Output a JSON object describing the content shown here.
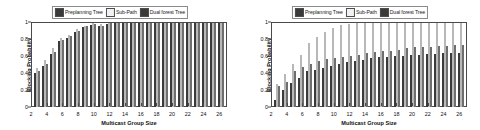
{
  "figure": {
    "panels": [
      {
        "id": "left-panel",
        "legend": {
          "items": [
            {
              "label": "Preplanning Tree",
              "color": "#3a3a3a",
              "icon": "legend-swatch-preplanning"
            },
            {
              "label": "Sub-Path",
              "color": "#f2f2f2",
              "icon": "legend-swatch-subpath"
            },
            {
              "label": "Dual forest Tree",
              "color": "#6e6e6e",
              "icon": "legend-swatch-dualforest"
            }
          ]
        },
        "chart_data": {
          "type": "bar",
          "title": "",
          "xlabel": "Multicast Group Size",
          "ylabel": "Blocking Probability",
          "xlim": [
            2,
            27
          ],
          "ylim": [
            0,
            1
          ],
          "yticks": [
            0,
            0.2,
            0.4,
            0.6,
            0.8,
            1
          ],
          "ytick_labels": [
            "0",
            "0.2",
            "0.4",
            "0.6",
            "0.8",
            "1"
          ],
          "xticks": [
            2,
            4,
            6,
            8,
            10,
            12,
            14,
            16,
            18,
            20,
            22,
            24,
            26
          ],
          "grid": false,
          "legend_position": "top-center",
          "categories": [
            3,
            4,
            5,
            6,
            7,
            8,
            9,
            10,
            11,
            12,
            13,
            14,
            15,
            16,
            17,
            18,
            19,
            20,
            21,
            22,
            23,
            24,
            25,
            26
          ],
          "series": [
            {
              "name": "Preplanning Tree",
              "color": "#3a3a3a",
              "values": [
                0.41,
                0.49,
                0.63,
                0.78,
                0.82,
                0.89,
                0.95,
                0.98,
                0.96,
                0.99,
                1.0,
                1.0,
                1.0,
                1.0,
                1.0,
                1.0,
                1.0,
                1.0,
                1.0,
                1.0,
                1.0,
                1.0,
                1.0,
                1.0
              ]
            },
            {
              "name": "Sub-Path",
              "color": "#ededed",
              "values": [
                0.46,
                0.56,
                0.7,
                0.82,
                0.86,
                0.93,
                0.97,
                1.0,
                0.99,
                1.0,
                1.0,
                1.0,
                1.0,
                1.0,
                1.0,
                1.0,
                1.0,
                1.0,
                1.0,
                1.0,
                1.0,
                1.0,
                1.0,
                1.0
              ]
            },
            {
              "name": "Dual forest Tree",
              "color": "#6e6e6e",
              "values": [
                0.43,
                0.51,
                0.66,
                0.8,
                0.84,
                0.91,
                0.96,
                0.99,
                0.97,
                1.0,
                1.0,
                1.0,
                1.0,
                1.0,
                1.0,
                1.0,
                1.0,
                1.0,
                1.0,
                1.0,
                1.0,
                1.0,
                1.0,
                1.0
              ]
            }
          ]
        }
      },
      {
        "id": "right-panel",
        "legend": {
          "items": [
            {
              "label": "Preplanning Tree",
              "color": "#3a3a3a",
              "icon": "legend-swatch-preplanning"
            },
            {
              "label": "Sub-Path",
              "color": "#f2f2f2",
              "icon": "legend-swatch-subpath"
            },
            {
              "label": "Dual forest Tree",
              "color": "#6e6e6e",
              "icon": "legend-swatch-dualforest"
            }
          ]
        },
        "chart_data": {
          "type": "bar",
          "title": "",
          "xlabel": "Multicast Group Size",
          "ylabel": "Blocking Probability",
          "xlim": [
            2,
            27
          ],
          "ylim": [
            0,
            1
          ],
          "yticks": [
            0,
            0.2,
            0.4,
            0.6,
            0.8,
            1
          ],
          "ytick_labels": [
            "0",
            "0.2",
            "0.4",
            "0.6",
            "0.8",
            "1"
          ],
          "xticks": [
            2,
            4,
            6,
            8,
            10,
            12,
            14,
            16,
            18,
            20,
            22,
            24,
            26
          ],
          "grid": false,
          "legend_position": "top-center",
          "categories": [
            3,
            4,
            5,
            6,
            7,
            8,
            9,
            10,
            11,
            12,
            13,
            14,
            15,
            16,
            17,
            18,
            19,
            20,
            21,
            22,
            23,
            24,
            25,
            26
          ],
          "series": [
            {
              "name": "Preplanning Tree",
              "color": "#3a3a3a",
              "values": [
                0.08,
                0.2,
                0.28,
                0.35,
                0.43,
                0.44,
                0.47,
                0.49,
                0.51,
                0.53,
                0.55,
                0.56,
                0.58,
                0.59,
                0.6,
                0.61,
                0.61,
                0.62,
                0.62,
                0.63,
                0.63,
                0.64,
                0.64,
                0.64
              ]
            },
            {
              "name": "Sub-Path",
              "color": "#ededed",
              "values": [
                0.27,
                0.39,
                0.51,
                0.62,
                0.76,
                0.83,
                0.89,
                0.94,
                0.98,
                0.99,
                1.0,
                1.0,
                1.0,
                1.0,
                1.0,
                1.0,
                1.0,
                1.0,
                1.0,
                1.0,
                1.0,
                1.0,
                1.0,
                1.0
              ]
            },
            {
              "name": "Dual forest Tree",
              "color": "#6e6e6e",
              "values": [
                0.25,
                0.3,
                0.43,
                0.48,
                0.51,
                0.55,
                0.57,
                0.58,
                0.6,
                0.61,
                0.62,
                0.64,
                0.66,
                0.67,
                0.67,
                0.68,
                0.7,
                0.71,
                0.71,
                0.72,
                0.73,
                0.73,
                0.74,
                0.74
              ]
            }
          ]
        }
      }
    ]
  }
}
